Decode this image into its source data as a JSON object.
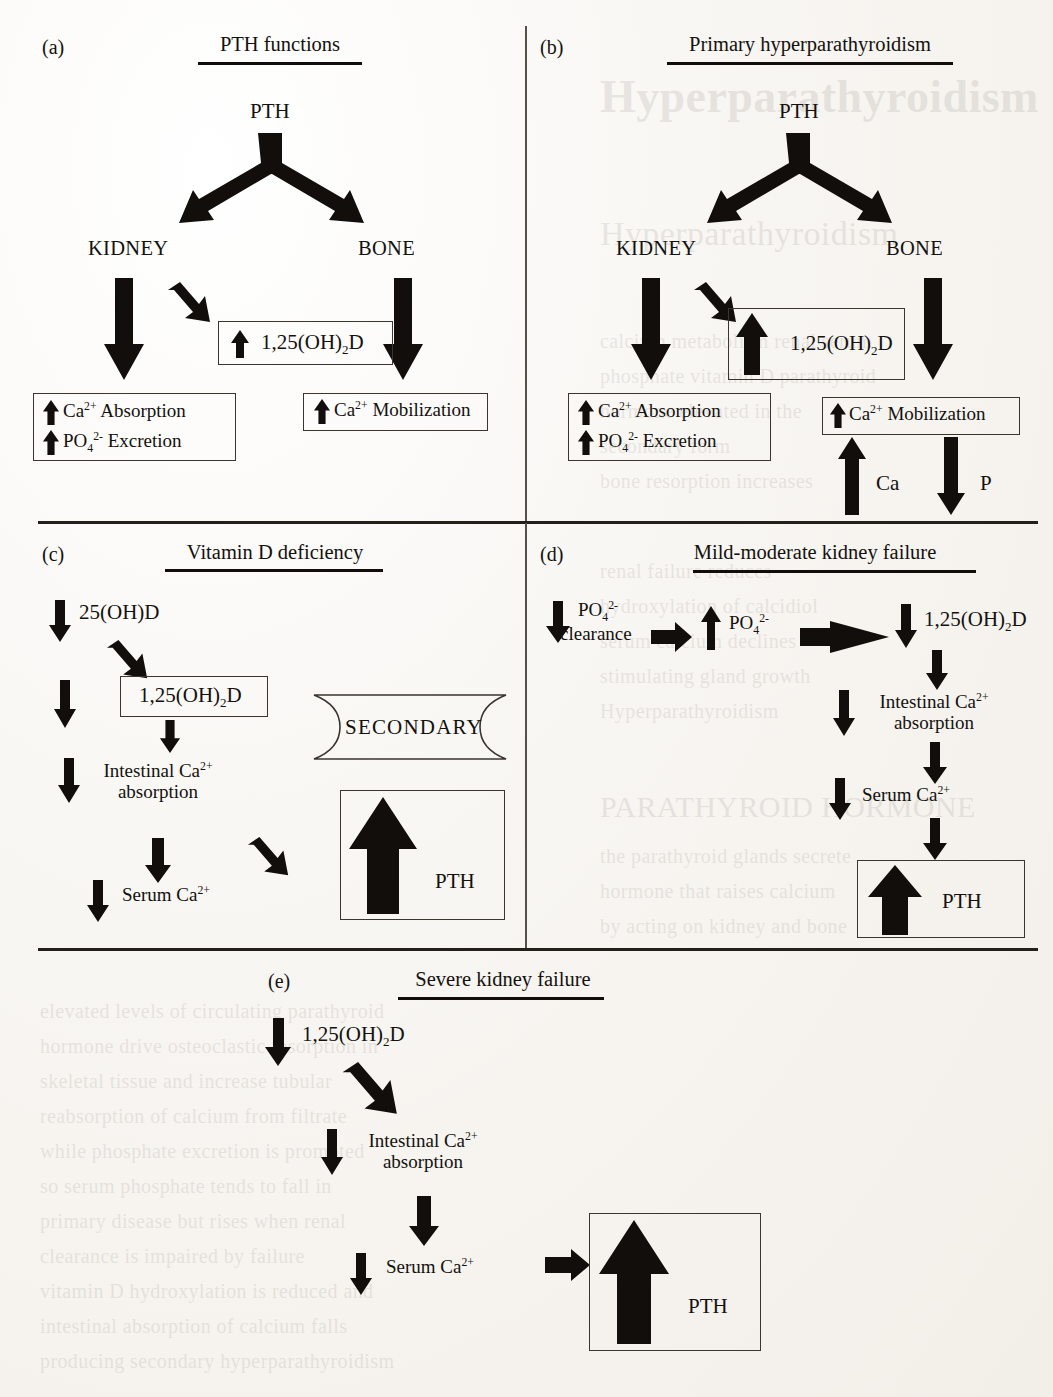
{
  "figure": {
    "type": "medical-flow-diagram"
  },
  "panels": [
    {
      "tag": "(a)",
      "title": "PTH functions",
      "nodes": {
        "root": "PTH",
        "left_organ": "KIDNEY",
        "right_organ": "BONE",
        "vit_d": "1,25(OH)₂D",
        "kidney_effect_1": "Ca²⁺ Absorption",
        "kidney_effect_2": "PO₄²⁻ Excretion",
        "bone_effect": "Ca²⁺ Mobilization"
      },
      "directions": {
        "vit_d": "up",
        "kidney_effect_1": "up",
        "kidney_effect_2": "up",
        "bone_effect": "up",
        "kidney_branch": "down",
        "bone_branch": "down"
      }
    },
    {
      "tag": "(b)",
      "title": "Primary hyperparathyroidism",
      "nodes": {
        "root": "PTH",
        "left_organ": "KIDNEY",
        "right_organ": "BONE",
        "vit_d": "1,25(OH)₂D",
        "kidney_effect_1": "Ca²⁺ Absorption",
        "kidney_effect_2": "PO₄²⁻ Excretion",
        "bone_effect": "Ca²⁺ Mobilization",
        "ca_release": "Ca",
        "p_release": "P"
      },
      "directions": {
        "vit_d": "up",
        "kidney_effect_1": "up",
        "kidney_effect_2": "up",
        "bone_effect": "up",
        "ca_release": "up",
        "p_release": "down"
      }
    },
    {
      "tag": "(c)",
      "title": "Vitamin D deficiency",
      "banner": "SECONDARY",
      "nodes": {
        "step_1": "25(OH)D",
        "step_2": "1,25(OH)₂D",
        "step_3_line1": "Intestinal Ca²⁺",
        "step_3_line2": "absorption",
        "step_4": "Serum Ca²⁺",
        "outcome": "PTH"
      },
      "directions": {
        "step_1": "down",
        "step_2": "down",
        "step_3": "down",
        "step_4": "down",
        "outcome": "up"
      }
    },
    {
      "tag": "(d)",
      "title": "Mild-moderate kidney failure",
      "nodes": {
        "step_1_line1": "PO₄²⁻",
        "step_1_line2": "clearance",
        "step_2": "PO₄²⁻",
        "step_3": "1,25(OH)₂D",
        "step_4_line1": "Intestinal Ca²⁺",
        "step_4_line2": "absorption",
        "step_5": "Serum Ca²⁺",
        "outcome": "PTH"
      },
      "directions": {
        "step_1": "down",
        "step_2": "up",
        "step_3": "down",
        "step_4": "down",
        "step_5": "down",
        "outcome": "up"
      }
    },
    {
      "tag": "(e)",
      "title": "Severe kidney failure",
      "nodes": {
        "step_1": "1,25(OH)₂D",
        "step_2_line1": "Intestinal Ca²⁺",
        "step_2_line2": "absorption",
        "step_3": "Serum Ca²⁺",
        "outcome": "PTH"
      },
      "directions": {
        "step_1": "down",
        "step_2": "down",
        "step_3": "down",
        "outcome": "up"
      }
    }
  ],
  "background_ghost_text": [
    "Primary Hyperparathyroidism",
    "Secondary Hyperparathyroidism",
    "PARATHYROID HORMONE",
    "calcium",
    "phosphate",
    "serum",
    "vitamin D",
    "renal"
  ],
  "colors": {
    "ink": "#110e0b",
    "paper": "#f8f6f2",
    "rule": "#23201c",
    "divider": "#55504a"
  }
}
